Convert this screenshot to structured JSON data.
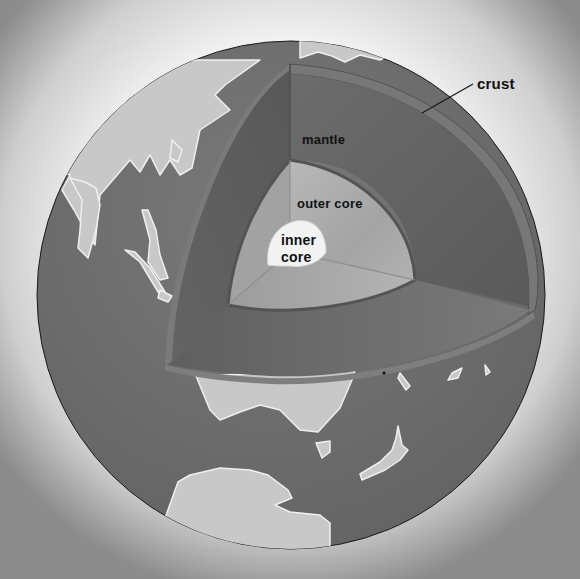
{
  "diagram": {
    "labels": {
      "crust": "crust",
      "mantle": "mantle",
      "outer_core": "outer core",
      "inner_core_line1": "inner",
      "inner_core_line2": "core"
    },
    "colors": {
      "background_center": "#ffffff",
      "background_edge": "#9a9a9a",
      "ocean": "#6f6f6f",
      "land": "#c9c9c9",
      "land_outline": "#eeeeee",
      "crust_face": "#6a6a6a",
      "mantle_face_left": "#5e5e5e",
      "mantle_face_right": "#666666",
      "mantle_face_bottom": "#727272",
      "outer_core_left": "#a0a0a0",
      "outer_core_right": "#b0b0b0",
      "outer_core_bottom": "#a8a8a8",
      "inner_core": "#f2f2f2",
      "label_text": "#111111"
    }
  }
}
